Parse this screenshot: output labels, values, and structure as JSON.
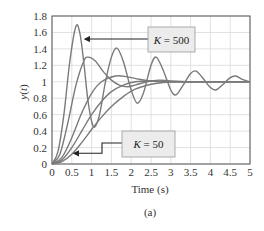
{
  "chart_data": {
    "type": "line",
    "title": "",
    "caption": "(a)",
    "xlabel": "Time (s)",
    "ylabel": "y(t)",
    "xlim": [
      0,
      5
    ],
    "ylim": [
      0,
      1.8
    ],
    "grid": true,
    "xticks": [
      0,
      0.5,
      1,
      1.5,
      2,
      2.5,
      3,
      3.5,
      4,
      4.5,
      5
    ],
    "xtick_labels": [
      "0",
      "0.5",
      "1",
      "1.5",
      "2",
      "2.5",
      "3",
      "3.5",
      "4",
      "4.5",
      "5"
    ],
    "yticks": [
      0,
      0.2,
      0.4,
      0.6,
      0.8,
      1,
      1.2,
      1.4,
      1.6,
      1.8
    ],
    "ytick_labels": [
      "0",
      "0.2",
      "0.4",
      "0.6",
      "0.8",
      "1",
      "1.2",
      "1.4",
      "1.6",
      "1.8"
    ],
    "line_color": "#7a7a7a",
    "series": [
      {
        "name": "K = 500",
        "x": [
          0,
          0.15,
          0.3,
          0.45,
          0.6,
          0.7,
          0.8,
          0.9,
          1.0,
          1.08,
          1.2,
          1.35,
          1.5,
          1.64,
          1.8,
          2.0,
          2.15,
          2.3,
          2.5,
          2.63,
          2.8,
          3.0,
          3.13,
          3.3,
          3.5,
          3.64,
          3.8,
          4.0,
          4.14,
          4.3,
          4.5,
          4.64,
          4.8,
          5.0
        ],
        "y": [
          0,
          0.15,
          0.6,
          1.25,
          1.67,
          1.6,
          1.25,
          0.8,
          0.52,
          0.45,
          0.6,
          1.0,
          1.3,
          1.41,
          1.25,
          0.9,
          0.74,
          0.85,
          1.2,
          1.3,
          1.15,
          0.9,
          0.84,
          0.95,
          1.1,
          1.13,
          1.05,
          0.93,
          0.9,
          0.96,
          1.05,
          1.07,
          1.03,
          1.0
        ]
      },
      {
        "name": "K = 200",
        "x": [
          0,
          0.2,
          0.4,
          0.6,
          0.8,
          0.91,
          1.1,
          1.3,
          1.5,
          1.7,
          1.9,
          2.1,
          2.4,
          2.7,
          3.0,
          3.5,
          4.0,
          5.0
        ],
        "y": [
          0,
          0.12,
          0.5,
          0.95,
          1.25,
          1.3,
          1.25,
          1.12,
          1.02,
          0.96,
          0.94,
          0.96,
          1.0,
          1.02,
          1.01,
          1.0,
          1.0,
          1.0
        ]
      },
      {
        "name": "K = 120",
        "x": [
          0,
          0.25,
          0.5,
          0.75,
          1.0,
          1.25,
          1.6,
          1.9,
          2.2,
          2.5,
          2.8,
          3.2,
          4.0,
          5.0
        ],
        "y": [
          0,
          0.08,
          0.32,
          0.62,
          0.86,
          1.0,
          1.07,
          1.06,
          1.03,
          1.01,
          1.0,
          1.0,
          1.0,
          1.0
        ]
      },
      {
        "name": "K = 80",
        "x": [
          0,
          0.25,
          0.5,
          0.75,
          1.0,
          1.25,
          1.5,
          1.8,
          2.1,
          2.5,
          3.0,
          3.5,
          4.0,
          5.0
        ],
        "y": [
          0,
          0.05,
          0.2,
          0.4,
          0.6,
          0.76,
          0.88,
          0.96,
          1.0,
          1.01,
          1.0,
          1.0,
          1.0,
          1.0
        ]
      },
      {
        "name": "K = 50",
        "x": [
          0,
          0.25,
          0.5,
          0.75,
          1.0,
          1.25,
          1.5,
          1.8,
          2.1,
          2.5,
          2.8,
          3.2,
          4.0,
          5.0
        ],
        "y": [
          0,
          0.03,
          0.12,
          0.26,
          0.42,
          0.57,
          0.7,
          0.82,
          0.91,
          0.97,
          0.99,
          1.0,
          1.0,
          1.0
        ]
      }
    ],
    "annotations": [
      {
        "text_k": "K",
        "text_rest": " = 500",
        "box": [
          148,
          27,
          47,
          25
        ],
        "arrow_to": [
          0.78,
          1.52
        ]
      },
      {
        "text_k": "K",
        "text_rest": " = 50",
        "box": [
          122,
          131,
          53,
          26
        ],
        "arrow_to": [
          0.5,
          0.13
        ]
      }
    ]
  }
}
